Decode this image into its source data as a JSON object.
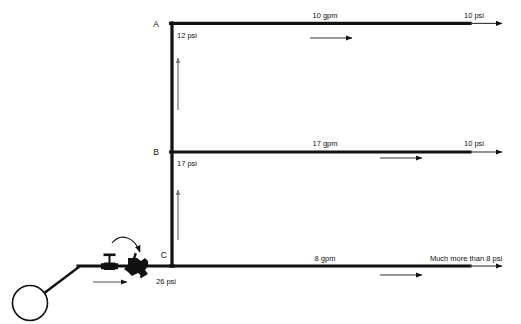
{
  "diagram": {
    "colors": {
      "pipe": "#111111",
      "text": "#111111",
      "background": "#ffffff"
    },
    "source": {
      "name": "pump-circle",
      "inlet_flow_arrow": "flow-right"
    },
    "valves": [
      {
        "id": "gate-valve",
        "type": "gate-valve"
      },
      {
        "id": "main-valve",
        "type": "throttling-valve",
        "callout": "curved-arrow"
      }
    ],
    "nodes": [
      {
        "id": "A",
        "label": "A",
        "pressure": "12 psi"
      },
      {
        "id": "B",
        "label": "B",
        "pressure": "17 psi"
      },
      {
        "id": "C",
        "label": "C",
        "pressure": "26 psi"
      }
    ],
    "branches": [
      {
        "id": "branch-a",
        "node": "A",
        "flow": "10 gpm",
        "outlet_pressure": "10 psi"
      },
      {
        "id": "branch-b",
        "node": "B",
        "flow": "17 gpm",
        "outlet_pressure": "10 psi"
      },
      {
        "id": "branch-c",
        "node": "C",
        "flow": "8 gpm",
        "outlet_pressure": "Much more than 8 psi"
      }
    ],
    "riser_arrows": [
      {
        "id": "riser-arrow-upper",
        "direction": "up"
      },
      {
        "id": "riser-arrow-lower",
        "direction": "up"
      }
    ]
  }
}
